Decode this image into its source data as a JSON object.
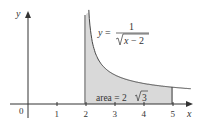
{
  "chart_data": {
    "type": "area",
    "title": "",
    "xlabel": "x",
    "ylabel": "y",
    "function": "y = 1/sqrt(x-2)",
    "equation_label": {
      "lhs": "y =",
      "numerator": "1",
      "denominator": "√x − 2"
    },
    "shaded_region": {
      "from": 2,
      "to": 5,
      "label": "area = 2√3"
    },
    "x_ticks": [
      "0",
      "1",
      "2",
      "3",
      "4",
      "5"
    ],
    "xlim": [
      -0.8,
      6
    ],
    "ylim": [
      0,
      3.2
    ],
    "curve_points": [
      {
        "x": 2.1,
        "y": 3.16
      },
      {
        "x": 2.25,
        "y": 2.0
      },
      {
        "x": 2.5,
        "y": 1.41
      },
      {
        "x": 3,
        "y": 1.0
      },
      {
        "x": 3.5,
        "y": 0.82
      },
      {
        "x": 4,
        "y": 0.71
      },
      {
        "x": 4.5,
        "y": 0.63
      },
      {
        "x": 5,
        "y": 0.58
      },
      {
        "x": 5.6,
        "y": 0.53
      }
    ],
    "vertical_asymptote": 2,
    "grid": false
  },
  "labels": {
    "origin": "0",
    "x_axis": "x",
    "y_axis": "y",
    "area": "area = 2",
    "area_radicand": "3",
    "eq_lhs": "y =",
    "eq_num": "1",
    "eq_den": "x − 2"
  },
  "colors": {
    "axis": "#333333",
    "curve": "#444444",
    "fill": "#d9d9d9"
  }
}
